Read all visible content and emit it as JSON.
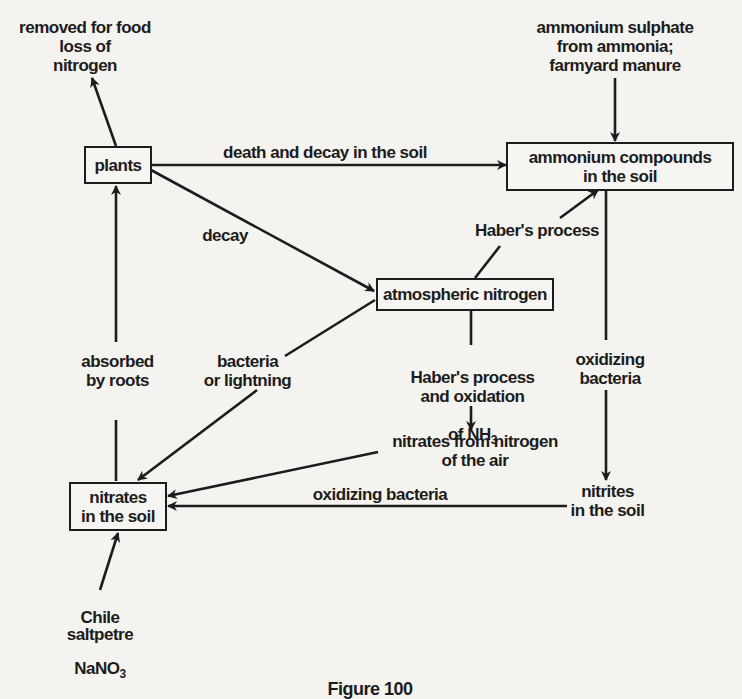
{
  "diagram": {
    "caption": "Figure 100",
    "nodes": {
      "plants": {
        "label": "plants",
        "boxed": true
      },
      "ammonium_compounds": {
        "label": "ammonium compounds\nin the soil",
        "boxed": true
      },
      "atmospheric_nitrogen": {
        "label": "atmospheric nitrogen",
        "boxed": true
      },
      "nitrates_soil": {
        "label": "nitrates\nin the soil",
        "boxed": true
      },
      "nitrites_soil": {
        "label": "nitrites\nin the soil",
        "boxed": false
      },
      "removed_for_food": {
        "label": "removed for food\nloss of\nnitrogen",
        "boxed": false
      },
      "ammonium_sulphate": {
        "label": "ammonium sulphate\nfrom ammonia;\nfarmyard manure",
        "boxed": false
      },
      "nitrates_from_air": {
        "label": "nitrates from nitrogen\nof the air",
        "boxed": false
      },
      "chile_saltpetre_1": {
        "label": "Chile\nsaltpetre"
      },
      "chile_saltpetre_formula": {
        "main": "NaNO",
        "sub": "3"
      }
    },
    "edge_labels": {
      "death_decay": "death and decay in the soil",
      "decay": "decay",
      "habers_process": "Haber's process",
      "absorbed_by_roots": "absorbed\nby roots",
      "bacteria_lightning": "bacteria\nor lightning",
      "haber_oxidation_1": "Haber's process\nand oxidation",
      "haber_oxidation_2": "of NH",
      "haber_oxidation_sub": "3",
      "oxidizing_bacteria_vertical": "oxidizing\nbacteria",
      "oxidizing_bacteria_horizontal": "oxidizing bacteria"
    },
    "edges": [
      {
        "from": "plants",
        "to": "removed_for_food",
        "label": ""
      },
      {
        "from": "plants",
        "to": "ammonium_compounds",
        "label": "death and decay in the soil"
      },
      {
        "from": "plants",
        "to": "atmospheric_nitrogen",
        "label": "decay"
      },
      {
        "from": "ammonium_sulphate",
        "to": "ammonium_compounds",
        "label": ""
      },
      {
        "from": "atmospheric_nitrogen",
        "to": "ammonium_compounds",
        "label": "Haber's process"
      },
      {
        "from": "atmospheric_nitrogen",
        "to": "nitrates_soil",
        "label": "bacteria or lightning"
      },
      {
        "from": "atmospheric_nitrogen",
        "to": "nitrates_from_air",
        "label": "Haber's process and oxidation of NH3"
      },
      {
        "from": "ammonium_compounds",
        "to": "nitrites_soil",
        "label": "oxidizing bacteria"
      },
      {
        "from": "nitrites_soil",
        "to": "nitrates_soil",
        "label": "oxidizing bacteria"
      },
      {
        "from": "nitrates_from_air",
        "to": "nitrates_soil",
        "label": ""
      },
      {
        "from": "nitrates_soil",
        "to": "plants",
        "label": "absorbed by roots"
      },
      {
        "from": "chile_saltpetre",
        "to": "nitrates_soil",
        "label": ""
      }
    ],
    "colors": {
      "ink": "#1c1c1c",
      "paper": "#f4f3ef"
    }
  }
}
